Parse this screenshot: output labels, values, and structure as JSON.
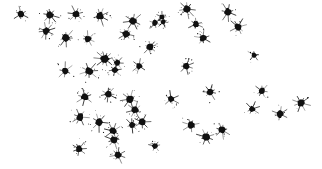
{
  "canvas": {
    "width": 322,
    "height": 169,
    "background_color": "#ffffff",
    "mark_color": "#111111"
  },
  "chart_data": {
    "type": "scatter",
    "title": "",
    "subtitle": "",
    "xlabel": "",
    "ylabel": "",
    "xlim": [
      0,
      322
    ],
    "ylim": [
      0,
      169
    ],
    "grid": false,
    "axes_visible": false,
    "legend": [],
    "tick_labels": {
      "x": [],
      "y": []
    },
    "annotations": [],
    "marker_style": "ink-splatter-star",
    "point_count": 45,
    "series": [
      {
        "name": "splatter-marks",
        "color": "#111111",
        "points": [
          {
            "x": 21,
            "y": 14,
            "r": 3.2,
            "spikes": 6,
            "rot": 12
          },
          {
            "x": 50,
            "y": 15,
            "r": 3.6,
            "spikes": 8,
            "rot": 40
          },
          {
            "x": 76,
            "y": 14,
            "r": 3.4,
            "spikes": 7,
            "rot": 75
          },
          {
            "x": 100,
            "y": 16,
            "r": 3.6,
            "spikes": 8,
            "rot": 20
          },
          {
            "x": 133,
            "y": 21,
            "r": 3.6,
            "spikes": 7,
            "rot": 55
          },
          {
            "x": 155,
            "y": 23,
            "r": 2.8,
            "spikes": 6,
            "rot": 5
          },
          {
            "x": 187,
            "y": 9,
            "r": 3.6,
            "spikes": 8,
            "rot": 33
          },
          {
            "x": 228,
            "y": 12,
            "r": 3.6,
            "spikes": 7,
            "rot": 64
          },
          {
            "x": 238,
            "y": 27,
            "r": 3.4,
            "spikes": 8,
            "rot": 15
          },
          {
            "x": 162,
            "y": 17,
            "r": 2.6,
            "spikes": 5,
            "rot": 48
          },
          {
            "x": 46,
            "y": 31,
            "r": 3.4,
            "spikes": 8,
            "rot": 22
          },
          {
            "x": 66,
            "y": 38,
            "r": 3.8,
            "spikes": 8,
            "rot": 70
          },
          {
            "x": 88,
            "y": 39,
            "r": 3.4,
            "spikes": 7,
            "rot": 8
          },
          {
            "x": 126,
            "y": 34,
            "r": 3.6,
            "spikes": 8,
            "rot": 52
          },
          {
            "x": 150,
            "y": 47,
            "r": 3.4,
            "spikes": 7,
            "rot": 30
          },
          {
            "x": 196,
            "y": 24,
            "r": 3.2,
            "spikes": 6,
            "rot": 84
          },
          {
            "x": 203,
            "y": 38,
            "r": 3.4,
            "spikes": 7,
            "rot": 18
          },
          {
            "x": 163,
            "y": 22,
            "r": 2.4,
            "spikes": 5,
            "rot": 60
          },
          {
            "x": 105,
            "y": 59,
            "r": 4.2,
            "spikes": 10,
            "rot": 25
          },
          {
            "x": 117,
            "y": 63,
            "r": 3.0,
            "spikes": 7,
            "rot": 45
          },
          {
            "x": 65,
            "y": 71,
            "r": 3.4,
            "spikes": 6,
            "rot": 10
          },
          {
            "x": 89,
            "y": 71,
            "r": 3.8,
            "spikes": 8,
            "rot": 66
          },
          {
            "x": 115,
            "y": 70,
            "r": 3.0,
            "spikes": 6,
            "rot": 35
          },
          {
            "x": 139,
            "y": 66,
            "r": 3.2,
            "spikes": 6,
            "rot": 78
          },
          {
            "x": 186,
            "y": 66,
            "r": 3.4,
            "spikes": 7,
            "rot": 14
          },
          {
            "x": 254,
            "y": 55,
            "r": 2.6,
            "spikes": 5,
            "rot": 50
          },
          {
            "x": 85,
            "y": 97,
            "r": 3.6,
            "spikes": 7,
            "rot": 28
          },
          {
            "x": 108,
            "y": 94,
            "r": 3.4,
            "spikes": 8,
            "rot": 72
          },
          {
            "x": 130,
            "y": 99,
            "r": 3.6,
            "spikes": 8,
            "rot": 16
          },
          {
            "x": 135,
            "y": 110,
            "r": 3.4,
            "spikes": 7,
            "rot": 58
          },
          {
            "x": 80,
            "y": 117,
            "r": 3.6,
            "spikes": 7,
            "rot": 41
          },
          {
            "x": 99,
            "y": 122,
            "r": 3.8,
            "spikes": 6,
            "rot": 6
          },
          {
            "x": 113,
            "y": 131,
            "r": 3.4,
            "spikes": 7,
            "rot": 68
          },
          {
            "x": 132,
            "y": 125,
            "r": 3.2,
            "spikes": 6,
            "rot": 24
          },
          {
            "x": 142,
            "y": 122,
            "r": 3.4,
            "spikes": 7,
            "rot": 80
          },
          {
            "x": 79,
            "y": 149,
            "r": 3.4,
            "spikes": 7,
            "rot": 37
          },
          {
            "x": 114,
            "y": 140,
            "r": 3.6,
            "spikes": 8,
            "rot": 62
          },
          {
            "x": 118,
            "y": 155,
            "r": 3.4,
            "spikes": 7,
            "rot": 11
          },
          {
            "x": 155,
            "y": 146,
            "r": 3.0,
            "spikes": 6,
            "rot": 47
          },
          {
            "x": 171,
            "y": 99,
            "r": 3.2,
            "spikes": 6,
            "rot": 74
          },
          {
            "x": 191,
            "y": 125,
            "r": 3.4,
            "spikes": 7,
            "rot": 29
          },
          {
            "x": 206,
            "y": 137,
            "r": 3.6,
            "spikes": 8,
            "rot": 54
          },
          {
            "x": 222,
            "y": 130,
            "r": 3.4,
            "spikes": 7,
            "rot": 19
          },
          {
            "x": 262,
            "y": 91,
            "r": 3.2,
            "spikes": 7,
            "rot": 43
          },
          {
            "x": 280,
            "y": 114,
            "r": 3.4,
            "spikes": 6,
            "rot": 76
          },
          {
            "x": 301,
            "y": 103,
            "r": 3.6,
            "spikes": 8,
            "rot": 9
          },
          {
            "x": 252,
            "y": 109,
            "r": 3.0,
            "spikes": 6,
            "rot": 31
          },
          {
            "x": 210,
            "y": 92,
            "r": 3.4,
            "spikes": 7,
            "rot": 57
          }
        ]
      }
    ]
  }
}
